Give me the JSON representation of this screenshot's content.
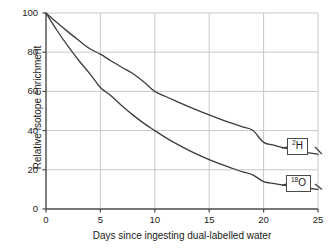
{
  "chart_data": {
    "type": "line",
    "title": "",
    "xlabel": "Days since ingesting dual-labelled water",
    "ylabel": "Relative isotope enrichment",
    "xlim": [
      0,
      25
    ],
    "ylim": [
      0,
      100
    ],
    "xticks": [
      0,
      5,
      10,
      15,
      20,
      25
    ],
    "yticks": [
      0,
      20,
      40,
      60,
      80,
      100
    ],
    "xtick_labels": [
      "0",
      "5",
      "10",
      "15",
      "20",
      "25"
    ],
    "ytick_labels": [
      "0",
      "20",
      "40",
      "60",
      "80",
      "100"
    ],
    "grid": true,
    "legend_position": "inline-end-labels",
    "x": [
      0,
      1,
      2,
      3,
      4,
      5,
      6,
      7,
      8,
      9,
      10,
      11,
      12,
      13,
      14,
      15,
      16,
      17,
      18,
      19,
      20,
      21,
      22,
      23,
      24,
      25
    ],
    "series": [
      {
        "name": "2H",
        "label_html": "<sup>2</sup>H",
        "label_sup": "2",
        "label_main": "H",
        "color": "#3c3c3c",
        "values": [
          100,
          95.1,
          90.5,
          86.1,
          81.9,
          79.0,
          75.5,
          72.2,
          69.0,
          64.8,
          60.0,
          57.4,
          54.9,
          52.5,
          50.2,
          48.0,
          45.9,
          43.9,
          42.0,
          40.2,
          34.0,
          32.5,
          31.1,
          29.8,
          28.8,
          28.0
        ]
      },
      {
        "name": "18O",
        "label_html": "<sup>18</sup>O",
        "label_sup": "18",
        "label_main": "O",
        "color": "#3c3c3c",
        "values": [
          100,
          91.2,
          83.2,
          75.9,
          69.2,
          62.0,
          57.6,
          52.5,
          47.9,
          43.7,
          40.0,
          36.4,
          33.2,
          30.3,
          27.6,
          25.2,
          23.0,
          21.0,
          19.1,
          17.4,
          14.0,
          13.0,
          12.1,
          11.3,
          10.6,
          10.0
        ]
      }
    ]
  },
  "axes": {
    "y_label": "Relative isotope enrichment",
    "x_label": "Days since ingesting dual-labelled water",
    "y_ticks": [
      "100",
      "80",
      "60",
      "40",
      "20",
      "0"
    ],
    "x_ticks": [
      "0",
      "5",
      "10",
      "15",
      "20",
      "25"
    ]
  },
  "annotations": {
    "deuterium": {
      "sup": "2",
      "main": "H"
    },
    "oxygen18": {
      "sup": "18",
      "main": "O"
    }
  },
  "colors": {
    "curve": "#3c3c3c",
    "axis": "#4a4a4a",
    "grid": "#c8c8c8",
    "text": "#1a1a1a",
    "background": "#ffffff"
  }
}
